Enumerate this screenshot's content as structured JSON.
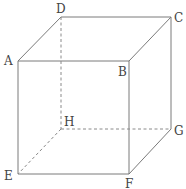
{
  "diagram": {
    "type": "cube",
    "vertices": {
      "A": {
        "label": "A",
        "x": 18,
        "y": 61
      },
      "B": {
        "label": "B",
        "x": 129,
        "y": 61
      },
      "C": {
        "label": "C",
        "x": 171,
        "y": 17
      },
      "D": {
        "label": "D",
        "x": 61,
        "y": 17
      },
      "E": {
        "label": "E",
        "x": 18,
        "y": 174
      },
      "F": {
        "label": "F",
        "x": 129,
        "y": 174
      },
      "G": {
        "label": "G",
        "x": 171,
        "y": 129
      },
      "H": {
        "label": "H",
        "x": 61,
        "y": 129
      }
    },
    "visible_edges": [
      "AB",
      "BC",
      "CD",
      "DA",
      "AE",
      "BF",
      "CG",
      "EF",
      "FG"
    ],
    "hidden_edges": [
      "DH",
      "HE",
      "HG"
    ],
    "colors": {
      "edge": "#7a7a7a",
      "label": "#444444",
      "background": "#ffffff"
    }
  }
}
